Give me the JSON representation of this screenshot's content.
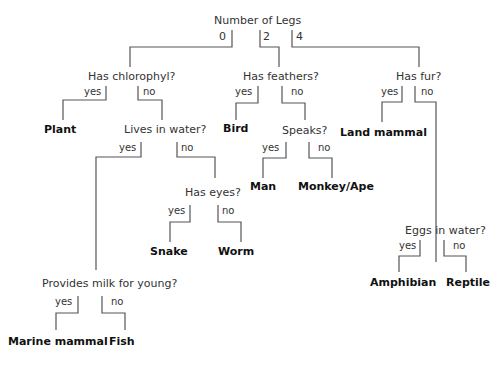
{
  "diagram": {
    "type": "decision-tree",
    "root": {
      "question": "Number of Legs",
      "branches": [
        "0",
        "2",
        "4"
      ]
    },
    "nodes": {
      "chlorophyl": {
        "question": "Has chlorophyl?",
        "yes": "yes",
        "no": "no"
      },
      "feathers": {
        "question": "Has feathers?",
        "yes": "yes",
        "no": "no"
      },
      "fur": {
        "question": "Has fur?",
        "yes": "yes",
        "no": "no"
      },
      "water": {
        "question": "Lives in water?",
        "yes": "yes",
        "no": "no"
      },
      "speaks": {
        "question": "Speaks?",
        "yes": "yes",
        "no": "no"
      },
      "eyes": {
        "question": "Has eyes?",
        "yes": "yes",
        "no": "no"
      },
      "eggs": {
        "question": "Eggs in water?",
        "yes": "yes",
        "no": "no"
      },
      "milk": {
        "question": "Provides milk for young?",
        "yes": "yes",
        "no": "no"
      }
    },
    "leaves": {
      "plant": "Plant",
      "bird": "Bird",
      "land_mammal": "Land mammal",
      "man": "Man",
      "monkey": "Monkey/Ape",
      "snake": "Snake",
      "worm": "Worm",
      "amphibian": "Amphibian",
      "reptile": "Reptile",
      "marine_mammal": "Marine mammal",
      "fish": "Fish"
    }
  }
}
